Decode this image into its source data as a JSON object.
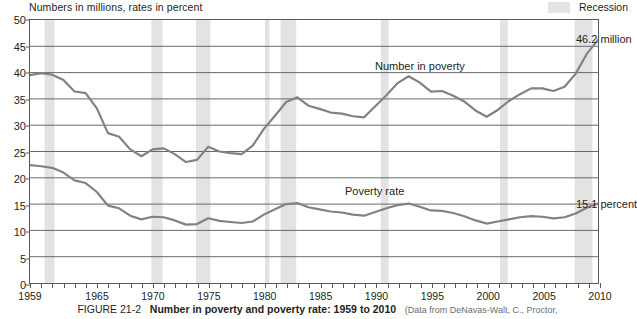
{
  "axis_note": "Numbers in millions, rates in percent",
  "legend": {
    "recession_label": "Recession",
    "recession_color": "#e3e3e3"
  },
  "series_labels": {
    "number_in_poverty": "Number in poverty",
    "poverty_rate": "Poverty rate"
  },
  "callouts": {
    "number_value": "46.2 million",
    "rate_value": "15.1 percent"
  },
  "caption": {
    "figure_number": "FIGURE 21-2",
    "title": "Number in poverty and poverty rate: 1959 to 2010",
    "source": "(Data from DeNavas-Walt, C., Proctor,"
  },
  "chart_data": {
    "type": "line",
    "title": "Number in poverty and poverty rate: 1959 to 2010",
    "xlabel": "",
    "ylabel": "Numbers in millions, rates in percent",
    "xlim": [
      1959,
      2010
    ],
    "ylim": [
      0,
      50
    ],
    "ytick_values": [
      0,
      5,
      10,
      15,
      20,
      25,
      30,
      35,
      40,
      45,
      50
    ],
    "xtick_labels": [
      1959,
      1965,
      1970,
      1975,
      1980,
      1985,
      1990,
      1995,
      2000,
      2005,
      2010
    ],
    "xtick_minor_step": 1,
    "grid": "horizontal",
    "legend_position": "top-right",
    "line_color": "#808285",
    "x": [
      1959,
      1960,
      1961,
      1962,
      1963,
      1964,
      1965,
      1966,
      1967,
      1968,
      1969,
      1970,
      1971,
      1972,
      1973,
      1974,
      1975,
      1976,
      1977,
      1978,
      1979,
      1980,
      1981,
      1982,
      1983,
      1984,
      1985,
      1986,
      1987,
      1988,
      1989,
      1990,
      1991,
      1992,
      1993,
      1994,
      1995,
      1996,
      1997,
      1998,
      1999,
      2000,
      2001,
      2002,
      2003,
      2004,
      2005,
      2006,
      2007,
      2008,
      2009,
      2010
    ],
    "series": [
      {
        "name": "Number in poverty",
        "unit": "millions",
        "values": [
          39.5,
          39.9,
          39.6,
          38.6,
          36.4,
          36.1,
          33.2,
          28.5,
          27.8,
          25.4,
          24.1,
          25.4,
          25.6,
          24.5,
          23.0,
          23.4,
          25.9,
          25.0,
          24.7,
          24.5,
          26.1,
          29.3,
          31.8,
          34.4,
          35.3,
          33.7,
          33.1,
          32.4,
          32.2,
          31.7,
          31.5,
          33.6,
          35.7,
          38.0,
          39.3,
          38.1,
          36.4,
          36.5,
          35.6,
          34.5,
          32.8,
          31.6,
          32.9,
          34.6,
          35.9,
          37.0,
          37.0,
          36.5,
          37.3,
          39.8,
          43.6,
          46.2
        ],
        "end_label": "46.2 million"
      },
      {
        "name": "Poverty rate",
        "unit": "percent",
        "values": [
          22.4,
          22.2,
          21.9,
          21.0,
          19.5,
          19.0,
          17.3,
          14.7,
          14.2,
          12.8,
          12.1,
          12.6,
          12.5,
          11.9,
          11.1,
          11.2,
          12.3,
          11.8,
          11.6,
          11.4,
          11.7,
          13.0,
          14.0,
          15.0,
          15.2,
          14.4,
          14.0,
          13.6,
          13.4,
          13.0,
          12.8,
          13.5,
          14.2,
          14.8,
          15.1,
          14.5,
          13.8,
          13.7,
          13.3,
          12.7,
          11.9,
          11.3,
          11.7,
          12.1,
          12.5,
          12.7,
          12.6,
          12.3,
          12.5,
          13.2,
          14.3,
          15.1
        ],
        "end_label": "15.1 percent"
      }
    ],
    "recession_bands": [
      {
        "start": 1960.3,
        "end": 1961.2
      },
      {
        "start": 1969.9,
        "end": 1970.9
      },
      {
        "start": 1973.9,
        "end": 1975.2
      },
      {
        "start": 1980.1,
        "end": 1980.5
      },
      {
        "start": 1981.5,
        "end": 1982.9
      },
      {
        "start": 1990.5,
        "end": 1991.2
      },
      {
        "start": 2001.2,
        "end": 2001.9
      },
      {
        "start": 2007.9,
        "end": 2009.5
      }
    ]
  }
}
